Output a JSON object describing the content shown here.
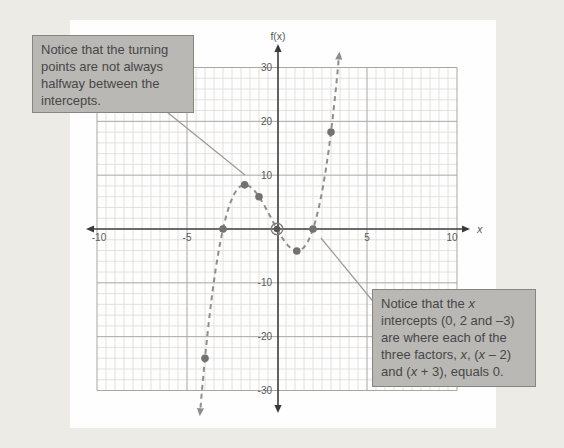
{
  "figure": {
    "background_color": "#ecebe6",
    "panel_color": "#fefefe"
  },
  "chart_data": {
    "type": "line",
    "title": "",
    "xlabel": "x",
    "ylabel": "f(x)",
    "xlim": [
      -10,
      10
    ],
    "ylim": [
      -30,
      30
    ],
    "x_major_ticks": [
      -10,
      -5,
      5,
      10
    ],
    "y_major_ticks": [
      30,
      20,
      10,
      -10,
      -20,
      -30
    ],
    "x_minor_step": 0.5,
    "y_minor_step": 2,
    "grid": "on",
    "legend": "none",
    "curve_style": "dashed",
    "curve_poly_coeffs": [
      1,
      1,
      -6,
      0
    ],
    "curve_domain": [
      -4.25,
      3.45
    ],
    "x_intercepts": [
      -3,
      0,
      2
    ],
    "turning_points": [
      [
        -1.8,
        8.2
      ],
      [
        1.1,
        -4.1
      ]
    ],
    "marked_points": [
      [
        -4,
        -24
      ],
      [
        -3,
        0
      ],
      [
        -1.8,
        8.2
      ],
      [
        -1,
        6
      ],
      [
        1.1,
        -4.1
      ],
      [
        2,
        0
      ],
      [
        3,
        18
      ]
    ],
    "highlighted_point": [
      0,
      0
    ],
    "colors": {
      "curve": "#8f8e8b",
      "point": "#73726e",
      "axis": "#3a3a3a",
      "grid_major": "#a8a7a2",
      "grid_minor": "#dcdbd4",
      "tick_label": "#5a5a58",
      "leader_line": "#9b9a96"
    }
  },
  "callouts": {
    "turning_points": {
      "lines": [
        "Notice that the turning",
        "points are not always",
        "halfway between the",
        "intercepts."
      ]
    },
    "x_intercepts": {
      "lines": [
        "Notice that the *x*",
        "intercepts (0, 2 and –3)",
        "are where each of the",
        "three factors, *x*, (*x* – 2)",
        "and (*x* + 3), equals 0."
      ]
    }
  }
}
